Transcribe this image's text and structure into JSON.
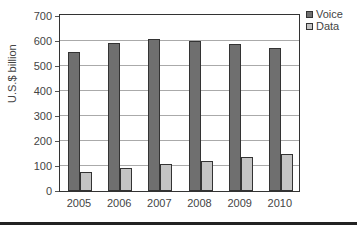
{
  "chart_data": {
    "type": "bar",
    "title": "",
    "xlabel": "",
    "ylabel": "U.S.$ billion",
    "ylim": [
      0,
      700
    ],
    "yticks": [
      0,
      100,
      200,
      300,
      400,
      500,
      600,
      700
    ],
    "grid": true,
    "legend_position": "right-top",
    "categories": [
      "2005",
      "2006",
      "2007",
      "2008",
      "2009",
      "2010"
    ],
    "series": [
      {
        "name": "Voice",
        "color": "#6f6f6f",
        "values": [
          556,
          592,
          608,
          602,
          590,
          572
        ]
      },
      {
        "name": "Data",
        "color": "#c4c4c4",
        "values": [
          78,
          94,
          108,
          120,
          135,
          150
        ]
      }
    ]
  },
  "labels": {
    "ylabel": "U.S.$ billion",
    "legend": [
      "Voice",
      "Data"
    ],
    "yticks": [
      "0",
      "100",
      "200",
      "300",
      "400",
      "500",
      "600",
      "700"
    ],
    "xticks": [
      "2005",
      "2006",
      "2007",
      "2008",
      "2009",
      "2010"
    ]
  }
}
